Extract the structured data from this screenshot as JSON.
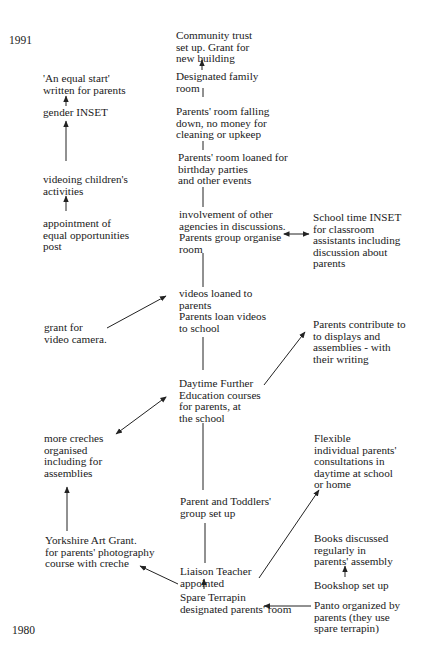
{
  "timeline": {
    "start_year": "1991",
    "end_year": "1980"
  },
  "nodes": {
    "community_trust": "Community trust\nset up.  Grant for\nnew building",
    "designated_family_room": "Designated family\nroom",
    "room_falling_down": "Parents' room falling\ndown, no money for\ncleaning or upkeep",
    "room_loaned": "Parents' room loaned for\nbirthday parties\n and other events",
    "other_agencies": "involvement of other\nagencies in discussions.\nParents group organise\nroom",
    "videos_loaned": "videos loaned to\nparents\nParents loan videos\nto school",
    "daytime_fe": "Daytime Further\nEducation courses\nfor parents, at\nthe school",
    "parent_toddlers": "Parent and Toddlers'\ngroup set up",
    "liaison_teacher": "Liaison Teacher\nappointed",
    "spare_terrapin": "Spare Terrapin\ndesignated parents' room",
    "equal_start": "'An equal start'\nwritten for parents",
    "gender_inset": "gender INSET",
    "videoing": "videoing children's\nactivities",
    "equal_opps_post": "appointment of\nequal opportunities\npost",
    "grant_video_camera": "grant for\nvideo camera.",
    "more_creches": "more creches\norganised\nincluding for\nassemblies",
    "yorkshire_art_grant": "Yorkshire Art Grant.\nfor parents' photography\ncourse with creche",
    "school_time_inset": "School time INSET\nfor classroom\nassistants including\ndiscussion about\nparents",
    "parents_contribute": "Parents contribute to\nto displays and\nassemblies - with\ntheir writing",
    "flexible_consultations": "Flexible\nindividual parents'\nconsultations in\ndaytime at school\nor home",
    "books_discussed": "Books discussed\n regularly in\nparents' assembly",
    "bookshop": "Bookshop set up",
    "panto": "Panto organized by\n parents (they use\nspare terrapin)"
  },
  "links": [
    {
      "from": "designated_family_room",
      "to": "community_trust",
      "type": "arrow"
    },
    {
      "from": "designated_family_room",
      "to": "room_falling_down",
      "type": "line"
    },
    {
      "from": "room_falling_down",
      "to": "room_loaned",
      "type": "line"
    },
    {
      "from": "room_loaned",
      "to": "other_agencies",
      "type": "line"
    },
    {
      "from": "other_agencies",
      "to": "videos_loaned",
      "type": "line"
    },
    {
      "from": "other_agencies",
      "to": "school_time_inset",
      "type": "double-arrow"
    },
    {
      "from": "videos_loaned",
      "to": "daytime_fe",
      "type": "line"
    },
    {
      "from": "daytime_fe",
      "to": "parent_toddlers",
      "type": "line"
    },
    {
      "from": "parent_toddlers",
      "to": "liaison_teacher",
      "type": "line"
    },
    {
      "from": "spare_terrapin",
      "to": "liaison_teacher",
      "type": "arrow"
    },
    {
      "from": "gender_inset",
      "to": "equal_start",
      "type": "arrow"
    },
    {
      "from": "videoing",
      "to": "gender_inset",
      "type": "arrow"
    },
    {
      "from": "equal_opps_post",
      "to": "videoing",
      "type": "arrow"
    },
    {
      "from": "grant_video_camera",
      "to": "videos_loaned",
      "type": "arrow"
    },
    {
      "from": "daytime_fe",
      "to": "more_creches",
      "type": "double-arrow"
    },
    {
      "from": "daytime_fe",
      "to": "parents_contribute",
      "type": "arrow"
    },
    {
      "from": "yorkshire_art_grant",
      "to": "more_creches",
      "type": "arrow"
    },
    {
      "from": "liaison_teacher",
      "to": "yorkshire_art_grant",
      "type": "arrow"
    },
    {
      "from": "liaison_teacher",
      "to": "flexible_consultations",
      "type": "arrow"
    },
    {
      "from": "bookshop",
      "to": "books_discussed",
      "type": "arrow"
    },
    {
      "from": "panto",
      "to": "spare_terrapin",
      "type": "arrow"
    }
  ]
}
